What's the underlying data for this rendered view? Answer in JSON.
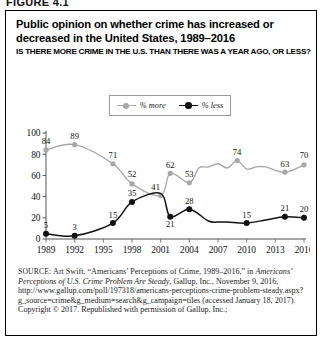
{
  "figure": {
    "label": "FIGURE 4.1"
  },
  "header": {
    "title": "Public opinion on whether crime has increased or decreased in the United States, 1989–2016",
    "subtitle": "IS THERE MORE CRIME IN THE U.S. THAN THERE WAS A YEAR AGO, OR LESS?"
  },
  "colors": {
    "more": "#a8a8a8",
    "less": "#111111",
    "axis": "#555555",
    "frame": "#000000",
    "text": "#111111"
  },
  "source": {
    "prefix": "SOURCE:",
    "line1": " Art Swift, “Americans’ Perceptions of Crime, 1989–2016,” in ",
    "italic": "Americans’ Perceptions of U.S. Crime Problem Are Steady",
    "line2": ", Gallup, Inc., November 9, 2016, http://www.gallup.com/poll/197318/americans-perceptions-crime-problem-steady.aspx?g_source=crime&g_medium=search&g_campaign=tiles (accessed January 18, 2017).",
    "line3": "Copyright © 2017. Republished with permission of Gallup, Inc.;"
  },
  "chart_data": {
    "type": "line",
    "title": "Public opinion on whether crime has increased or decreased in the United States, 1989–2016",
    "subtitle": "IS THERE MORE CRIME IN THE U.S. THAN THERE WAS A YEAR AGO, OR LESS?",
    "xlabel": "",
    "ylabel": "",
    "ylim": [
      0,
      100
    ],
    "yticks": [
      0,
      20,
      40,
      60,
      80,
      100
    ],
    "xticks": [
      "1989",
      "1992",
      "1995",
      "1998",
      "2001",
      "2004",
      "2007",
      "2010",
      "2013",
      "2016"
    ],
    "xlim": [
      1989,
      2016
    ],
    "grid": false,
    "legend_position": "top-center",
    "legend": [
      "% more",
      "% less"
    ],
    "series": [
      {
        "name": "% more",
        "color": "#a8a8a8",
        "points": [
          {
            "x": 1989,
            "y": 84,
            "label": "84"
          },
          {
            "x": 1992,
            "y": 89,
            "label": "89"
          },
          {
            "x": 1996,
            "y": 71,
            "label": "71"
          },
          {
            "x": 1998,
            "y": 52,
            "label": "52"
          },
          {
            "x": 2001,
            "y": 41,
            "label": "41"
          },
          {
            "x": 2002,
            "y": 62,
            "label": "62"
          },
          {
            "x": 2004,
            "y": 53,
            "label": "53"
          },
          {
            "x": 2005,
            "y": 67,
            "label": ""
          },
          {
            "x": 2006,
            "y": 68,
            "label": ""
          },
          {
            "x": 2007,
            "y": 71,
            "label": ""
          },
          {
            "x": 2008,
            "y": 67,
            "label": ""
          },
          {
            "x": 2009,
            "y": 74,
            "label": "74"
          },
          {
            "x": 2010,
            "y": 66,
            "label": ""
          },
          {
            "x": 2011,
            "y": 68,
            "label": ""
          },
          {
            "x": 2012,
            "y": 68,
            "label": ""
          },
          {
            "x": 2014,
            "y": 63,
            "label": "63"
          },
          {
            "x": 2016,
            "y": 70,
            "label": "70"
          }
        ]
      },
      {
        "name": "% less",
        "color": "#111111",
        "points": [
          {
            "x": 1989,
            "y": 5,
            "label": "5"
          },
          {
            "x": 1992,
            "y": 3,
            "label": "3"
          },
          {
            "x": 1996,
            "y": 15,
            "label": "15"
          },
          {
            "x": 1998,
            "y": 35,
            "label": "35"
          },
          {
            "x": 2001,
            "y": 43,
            "label": ""
          },
          {
            "x": 2002,
            "y": 21,
            "label": "21"
          },
          {
            "x": 2004,
            "y": 28,
            "label": "28"
          },
          {
            "x": 2006,
            "y": 17,
            "label": ""
          },
          {
            "x": 2007,
            "y": 16,
            "label": ""
          },
          {
            "x": 2008,
            "y": 16,
            "label": ""
          },
          {
            "x": 2010,
            "y": 15,
            "label": "15"
          },
          {
            "x": 2012,
            "y": 18,
            "label": ""
          },
          {
            "x": 2014,
            "y": 21,
            "label": "21"
          },
          {
            "x": 2016,
            "y": 20,
            "label": "20"
          }
        ]
      }
    ]
  }
}
